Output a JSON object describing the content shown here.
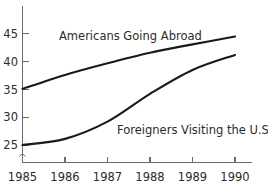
{
  "chart_data": {
    "type": "line",
    "title": "",
    "xlabel": "",
    "ylabel": "",
    "categories": [
      "1985",
      "1986",
      "1987",
      "1988",
      "1989",
      "1990"
    ],
    "x": [
      1985,
      1986,
      1987,
      1988,
      1989,
      1990
    ],
    "xlim": [
      1985,
      1990
    ],
    "ylim": [
      24,
      46
    ],
    "grid": false,
    "legend_position": "inline-annotation",
    "y_axis_break": true,
    "y_ticks": [
      25,
      30,
      35,
      40,
      45
    ],
    "y_tick_labels": [
      "25",
      "30",
      "35",
      "40",
      "45"
    ],
    "x_ticks": [
      1985,
      1986,
      1987,
      1988,
      1989,
      1990
    ],
    "x_tick_labels": [
      "1985",
      "1986",
      "1987",
      "1988",
      "1989",
      "1990"
    ],
    "series": [
      {
        "name": "Americans Going Abroad",
        "values": [
          35.1,
          37.6,
          39.7,
          41.6,
          43.1,
          44.5
        ]
      },
      {
        "name": "Foreigners Visiting the U.S.",
        "values": [
          25.0,
          26.1,
          29.2,
          34.2,
          38.5,
          41.2
        ]
      }
    ],
    "annotations": [
      {
        "name": "americans-going-abroad-label",
        "text": "Americans Going Abroad",
        "x_px": 59,
        "y_px": 40
      },
      {
        "name": "foreigners-visiting-label",
        "text": "Foreigners Visiting the U.S.",
        "x_px": 117,
        "y_px": 134
      }
    ],
    "colors": {
      "line": "#1a1a1a",
      "axis": "#6b6b6b",
      "text": "#2b2b2b",
      "background": "#ffffff"
    }
  },
  "axis": {
    "y_labels": [
      "45",
      "40",
      "35",
      "30",
      "25"
    ],
    "x_labels": [
      "1985",
      "1986",
      "1987",
      "1988",
      "1989",
      "1990"
    ]
  },
  "labels": {
    "series_one": "Americans Going Abroad",
    "series_two": "Foreigners Visiting the U.S."
  }
}
